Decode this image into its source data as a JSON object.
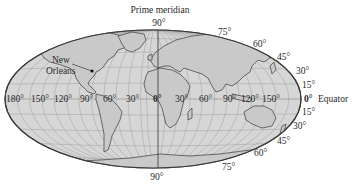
{
  "title": "Prime meridian",
  "north_pole_label": "90°",
  "south_pole_label": "90°",
  "city_label_line1": "New",
  "city_label_line2": "Orleans",
  "equator_label": "Equator",
  "equator_zero": "0°",
  "longitude_labels": [
    "180°",
    "150°",
    "120°",
    "90°",
    "60°",
    "30°",
    "0°",
    "30°",
    "60°",
    "90°",
    "120°",
    "150°"
  ],
  "north_latitude_labels": [
    "75°",
    "60°",
    "45°",
    "30°",
    "15°"
  ],
  "south_latitude_labels": [
    "15°",
    "30°",
    "45°",
    "60°",
    "75°"
  ],
  "colors": {
    "ocean": "#d4d4d4",
    "land": "#c8c8c8",
    "outline": "#555555",
    "grid": "#9a9a9a",
    "coast": "#444444"
  }
}
